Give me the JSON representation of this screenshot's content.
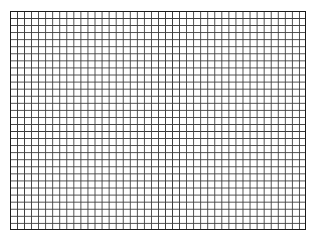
{
  "grid": {
    "columns": 42,
    "rows": 31,
    "line_color": "#3a3a3a",
    "border_color": "#1a1a1a",
    "background": "#ffffff"
  }
}
